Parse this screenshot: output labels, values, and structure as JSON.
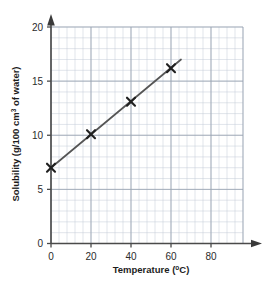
{
  "chart_data": {
    "type": "line",
    "title": "",
    "subtitle": "",
    "xlabel": "Temperature (°C)",
    "ylabel": "Solubility (g/100 cm³ of water)",
    "ylabel_parts": {
      "before": "Solubility (g/100 cm",
      "superscript": "3",
      "after": " of water)"
    },
    "xlabel_parts": {
      "before": "Temperature (",
      "superscript": "o",
      "after": "C)"
    },
    "xlim": [
      0,
      96
    ],
    "ylim": [
      0,
      20
    ],
    "xticks": [
      "0",
      "20",
      "40",
      "60",
      "80"
    ],
    "xtick_values": [
      0,
      20,
      40,
      60,
      80
    ],
    "yticks": [
      "0",
      "5",
      "10",
      "15",
      "20"
    ],
    "ytick_values": [
      0,
      5,
      10,
      15,
      20
    ],
    "x_minor_step": 4,
    "y_minor_step": 1,
    "grid": true,
    "grid_color": "#c3cbd6",
    "grid_major_color": "#9aa4b2",
    "axis_color": "#4a4a4a",
    "series_color": "#555555",
    "marker": "x-cross",
    "legend": "none",
    "series": [
      {
        "name": "Solubility",
        "x": [
          0,
          20,
          40,
          60
        ],
        "values": [
          7.0,
          10.1,
          13.1,
          16.2
        ]
      }
    ],
    "line_fit": {
      "x_start": 0,
      "y_start": 7.0,
      "x_end": 65,
      "y_end": 17.0
    },
    "points": [
      {
        "x": 0,
        "y": 7.0
      },
      {
        "x": 20,
        "y": 10.1
      },
      {
        "x": 40,
        "y": 13.1
      },
      {
        "x": 60,
        "y": 16.2
      }
    ]
  }
}
